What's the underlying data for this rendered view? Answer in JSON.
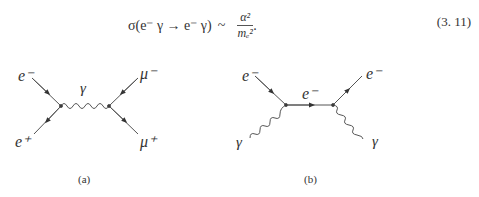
{
  "equation": {
    "lhs": "σ(e⁻ γ → e⁻ γ)",
    "relation": "~",
    "numerator": "α²",
    "denominator": "mₑ²",
    "trailing": ".",
    "number": "(3. 11)"
  },
  "diagram_a": {
    "labels": {
      "in_top": "e⁻",
      "in_bottom": "e⁺",
      "propagator": "γ",
      "out_top": "μ⁻",
      "out_bottom": "μ⁺"
    },
    "caption": "(a)"
  },
  "diagram_b": {
    "labels": {
      "in_top": "e⁻",
      "in_bottom": "γ",
      "propagator": "e⁻",
      "out_top": "e⁻",
      "out_bottom": "γ"
    },
    "caption": "(b)"
  }
}
